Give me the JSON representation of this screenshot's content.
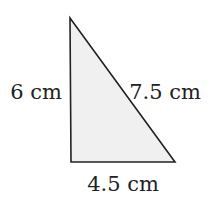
{
  "diagram": {
    "shape": "right-triangle",
    "fill_color": "#f0f0f0",
    "stroke_color": "#222222",
    "vertices": {
      "top": [
        70,
        18
      ],
      "bottom_left": [
        71,
        162
      ],
      "bottom_right": [
        175,
        162
      ]
    },
    "labels": {
      "height": "6 cm",
      "hypotenuse": "7.5 cm",
      "base": "4.5 cm"
    }
  }
}
